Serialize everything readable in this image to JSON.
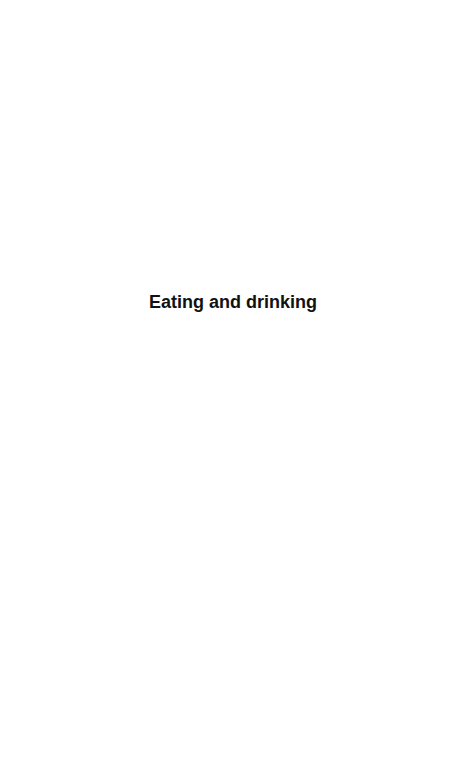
{
  "page": {
    "title": "Eating and drinking",
    "background_color": "#ffffff",
    "text_color": "#111111"
  }
}
